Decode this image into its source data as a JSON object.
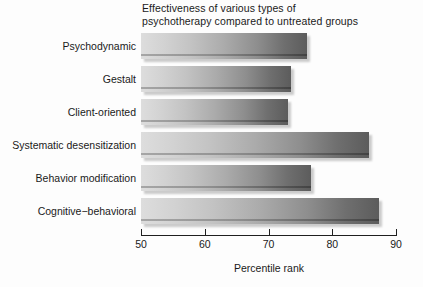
{
  "chart_data": {
    "type": "bar",
    "orientation": "horizontal",
    "title": "Effectiveness of various types of\npsychotherapy compared to untreated groups",
    "xlabel": "Percentile rank",
    "ylabel": "",
    "xlim": [
      50,
      90
    ],
    "xticks": [
      50,
      60,
      70,
      80,
      90
    ],
    "xtick_labels": [
      "50",
      "60",
      "70",
      "80",
      "90"
    ],
    "grid": false,
    "legend": null,
    "categories": [
      "Psychodynamic",
      "Gestalt",
      "Client-oriented",
      "Systematic desensitization",
      "Behavior modification",
      "Cognitive−behavioral"
    ],
    "values": [
      76.0,
      73.5,
      73.0,
      85.8,
      76.7,
      87.3
    ],
    "bar_style": {
      "gradient_start_color": "#dddddd",
      "gradient_end_color": "#5c5c5c",
      "shadow_color": "#787878"
    }
  }
}
